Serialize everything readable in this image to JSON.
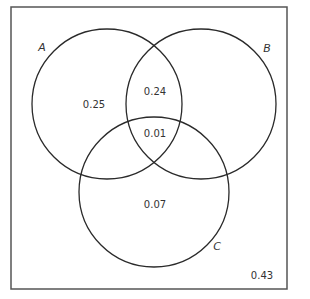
{
  "diagram": {
    "type": "venn-3-set",
    "sets": [
      {
        "id": "A",
        "label": "A"
      },
      {
        "id": "B",
        "label": "B"
      },
      {
        "id": "C",
        "label": "C"
      }
    ],
    "regions": {
      "A_only": "0.25",
      "A_and_B_only": "0.24",
      "A_and_B_and_C": "0.01",
      "C_only": "0.07",
      "outside": "0.43"
    },
    "stroke_color": "#2a2a2a",
    "frame_color": "#555555"
  }
}
